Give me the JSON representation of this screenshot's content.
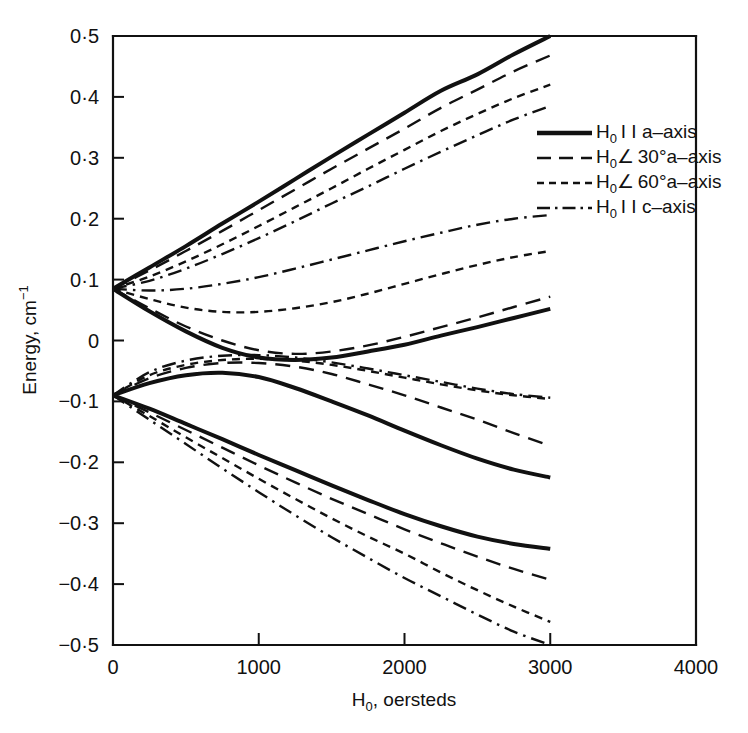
{
  "figure": {
    "background": "#ffffff",
    "ink_color": "#111111"
  },
  "chart_data": {
    "type": "line",
    "title": "",
    "subtitle": "",
    "xlabel": "H0, oersteds",
    "xlabel_base": "H",
    "xlabel_sub": "0",
    "xlabel_rest": ", oersteds",
    "ylabel": "Energy, cm-1",
    "ylabel_base": "Energy, cm",
    "ylabel_sup": "−1",
    "xlim": [
      0,
      4000
    ],
    "ylim": [
      -0.5,
      0.5
    ],
    "xticks": [
      0,
      1000,
      2000,
      3000,
      4000
    ],
    "xticklabels": [
      "0",
      "1000",
      "2000",
      "3000",
      "4000"
    ],
    "yticks": [
      0.5,
      0.4,
      0.3,
      0.2,
      0.1,
      0,
      -0.1,
      -0.2,
      -0.3,
      -0.4,
      -0.5
    ],
    "yticklabels": [
      "0·5",
      "0·4",
      "0·3",
      "0·2",
      "0·1",
      "0",
      "−0·1",
      "−0·2",
      "−0·3",
      "−0·4",
      "−0·5"
    ],
    "grid": false,
    "legend_position": "upper-right-inside",
    "zero_field_levels": [
      0.085,
      -0.09
    ],
    "x_data_range": [
      0,
      3000
    ],
    "series": [
      {
        "name": "H0||a-axis",
        "style": "solid",
        "branches": [
          {
            "id": "a-upper-1",
            "x": [
              0,
              250,
              500,
              750,
              1000,
              1250,
              1500,
              1750,
              2000,
              2250,
              2500,
              2750,
              3000
            ],
            "y": [
              0.085,
              0.12,
              0.155,
              0.192,
              0.228,
              0.265,
              0.302,
              0.338,
              0.374,
              0.41,
              0.437,
              0.47,
              0.5
            ]
          },
          {
            "id": "a-upper-2",
            "x": [
              0,
              250,
              500,
              750,
              1000,
              1250,
              1500,
              1750,
              2000,
              2250,
              2500,
              2750,
              3000
            ],
            "y": [
              0.085,
              0.048,
              0.015,
              -0.012,
              -0.028,
              -0.032,
              -0.028,
              -0.018,
              -0.007,
              0.008,
              0.022,
              0.037,
              0.052
            ]
          },
          {
            "id": "a-lower-1",
            "x": [
              0,
              250,
              500,
              750,
              1000,
              1250,
              1500,
              1750,
              2000,
              2250,
              2500,
              2750,
              3000
            ],
            "y": [
              -0.09,
              -0.07,
              -0.057,
              -0.053,
              -0.06,
              -0.078,
              -0.1,
              -0.123,
              -0.148,
              -0.172,
              -0.194,
              -0.212,
              -0.225
            ]
          },
          {
            "id": "a-lower-2",
            "x": [
              0,
              250,
              500,
              750,
              1000,
              1250,
              1500,
              1750,
              2000,
              2250,
              2500,
              2750,
              3000
            ],
            "y": [
              -0.09,
              -0.112,
              -0.137,
              -0.162,
              -0.188,
              -0.213,
              -0.238,
              -0.262,
              -0.285,
              -0.305,
              -0.322,
              -0.334,
              -0.342
            ]
          }
        ]
      },
      {
        "name": "H0/30 deg a-axis",
        "style": "long-dash",
        "branches": [
          {
            "id": "d30-upper-1",
            "x": [
              0,
              250,
              500,
              750,
              1000,
              1250,
              1500,
              1750,
              2000,
              2250,
              2500,
              2750,
              3000
            ],
            "y": [
              0.085,
              0.115,
              0.147,
              0.18,
              0.214,
              0.248,
              0.282,
              0.315,
              0.348,
              0.382,
              0.412,
              0.442,
              0.468
            ]
          },
          {
            "id": "d30-upper-2",
            "x": [
              0,
              250,
              500,
              750,
              1000,
              1250,
              1500,
              1750,
              2000,
              2250,
              2500,
              2750,
              3000
            ],
            "y": [
              0.085,
              0.053,
              0.023,
              0.0,
              -0.016,
              -0.022,
              -0.018,
              -0.008,
              0.006,
              0.022,
              0.038,
              0.055,
              0.072
            ]
          },
          {
            "id": "d30-lower-1",
            "x": [
              0,
              250,
              500,
              750,
              1000,
              1250,
              1500,
              1750,
              2000,
              2250,
              2500,
              2750,
              3000
            ],
            "y": [
              -0.09,
              -0.062,
              -0.045,
              -0.037,
              -0.037,
              -0.043,
              -0.055,
              -0.072,
              -0.09,
              -0.11,
              -0.13,
              -0.152,
              -0.173
            ]
          },
          {
            "id": "d30-lower-2",
            "x": [
              0,
              250,
              500,
              750,
              1000,
              1250,
              1500,
              1750,
              2000,
              2250,
              2500,
              2750,
              3000
            ],
            "y": [
              -0.09,
              -0.118,
              -0.147,
              -0.176,
              -0.205,
              -0.233,
              -0.26,
              -0.285,
              -0.31,
              -0.333,
              -0.355,
              -0.375,
              -0.393
            ]
          }
        ]
      },
      {
        "name": "H0/60 deg a-axis",
        "style": "short-dash",
        "branches": [
          {
            "id": "d60-upper-1",
            "x": [
              0,
              250,
              500,
              750,
              1000,
              1250,
              1500,
              1750,
              2000,
              2250,
              2500,
              2750,
              3000
            ],
            "y": [
              0.085,
              0.105,
              0.13,
              0.158,
              0.188,
              0.219,
              0.25,
              0.282,
              0.313,
              0.344,
              0.372,
              0.398,
              0.42
            ]
          },
          {
            "id": "d60-upper-2",
            "x": [
              0,
              250,
              500,
              750,
              1000,
              1250,
              1500,
              1750,
              2000,
              2250,
              2500,
              2750,
              3000
            ],
            "y": [
              0.085,
              0.068,
              0.054,
              0.047,
              0.047,
              0.053,
              0.063,
              0.077,
              0.093,
              0.109,
              0.124,
              0.137,
              0.147
            ]
          },
          {
            "id": "d60-lower-1",
            "x": [
              0,
              250,
              500,
              750,
              1000,
              1250,
              1500,
              1750,
              2000,
              2250,
              2500,
              2750,
              3000
            ],
            "y": [
              -0.09,
              -0.057,
              -0.04,
              -0.032,
              -0.03,
              -0.033,
              -0.04,
              -0.05,
              -0.061,
              -0.072,
              -0.082,
              -0.09,
              -0.096
            ]
          },
          {
            "id": "d60-lower-2",
            "x": [
              0,
              250,
              500,
              750,
              1000,
              1250,
              1500,
              1750,
              2000,
              2250,
              2500,
              2750,
              3000
            ],
            "y": [
              -0.09,
              -0.124,
              -0.159,
              -0.193,
              -0.227,
              -0.26,
              -0.292,
              -0.322,
              -0.35,
              -0.381,
              -0.41,
              -0.437,
              -0.462
            ]
          }
        ]
      },
      {
        "name": "H0||c-axis",
        "style": "dash-dot",
        "branches": [
          {
            "id": "c-upper-1",
            "x": [
              0,
              250,
              500,
              750,
              1000,
              1250,
              1500,
              1750,
              2000,
              2250,
              2500,
              2750,
              3000
            ],
            "y": [
              0.085,
              0.098,
              0.118,
              0.142,
              0.168,
              0.196,
              0.225,
              0.253,
              0.282,
              0.31,
              0.337,
              0.363,
              0.385
            ]
          },
          {
            "id": "c-upper-2",
            "x": [
              0,
              250,
              500,
              750,
              1000,
              1250,
              1500,
              1750,
              2000,
              2250,
              2500,
              2750,
              3000
            ],
            "y": [
              0.085,
              0.082,
              0.085,
              0.093,
              0.104,
              0.118,
              0.133,
              0.148,
              0.163,
              0.177,
              0.19,
              0.2,
              0.206
            ]
          },
          {
            "id": "c-lower-1",
            "x": [
              0,
              250,
              500,
              750,
              1000,
              1250,
              1500,
              1750,
              2000,
              2250,
              2500,
              2750,
              3000
            ],
            "y": [
              -0.09,
              -0.052,
              -0.033,
              -0.025,
              -0.024,
              -0.028,
              -0.036,
              -0.046,
              -0.057,
              -0.068,
              -0.079,
              -0.088,
              -0.094
            ]
          },
          {
            "id": "c-lower-2",
            "x": [
              0,
              250,
              500,
              750,
              1000,
              1250,
              1500,
              1750,
              2000,
              2250,
              2500,
              2750,
              3000
            ],
            "y": [
              -0.09,
              -0.13,
              -0.17,
              -0.21,
              -0.249,
              -0.287,
              -0.323,
              -0.357,
              -0.39,
              -0.42,
              -0.45,
              -0.478,
              -0.5
            ]
          }
        ]
      }
    ]
  },
  "legend": {
    "entries": [
      {
        "sample": "solid",
        "base": "H",
        "sub": "0",
        "rest": " I I a–axis"
      },
      {
        "sample": "long-dash",
        "base": "H",
        "sub": "0",
        "rest": "∠ 30°a–axis"
      },
      {
        "sample": "short-dash",
        "base": "H",
        "sub": "0",
        "rest": "∠ 60°a–axis"
      },
      {
        "sample": "dash-dot",
        "base": "H",
        "sub": "0",
        "rest": " I I c–axis"
      }
    ]
  }
}
